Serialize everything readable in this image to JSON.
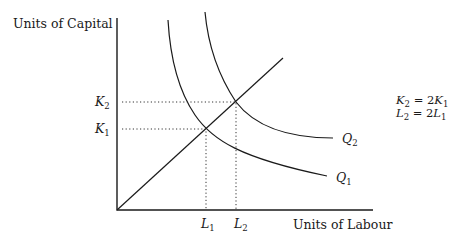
{
  "diagram": {
    "type": "isoquant returns-to-scale diagram",
    "y_axis_label": "Units of Capital",
    "x_axis_label": "Units of Labour",
    "capital_levels": [
      {
        "symbol": "K",
        "subscript": "1"
      },
      {
        "symbol": "K",
        "subscript": "2"
      }
    ],
    "labour_levels": [
      {
        "symbol": "L",
        "subscript": "1"
      },
      {
        "symbol": "L",
        "subscript": "2"
      }
    ],
    "isoquants": [
      {
        "symbol": "Q",
        "subscript": "1"
      },
      {
        "symbol": "Q",
        "subscript": "2"
      }
    ],
    "equations": [
      {
        "lhs_symbol": "K",
        "lhs_sub": "2",
        "op": " = 2",
        "rhs_symbol": "K",
        "rhs_sub": "1"
      },
      {
        "lhs_symbol": "L",
        "lhs_sub": "2",
        "op": " = 2",
        "rhs_symbol": "L",
        "rhs_sub": "1"
      }
    ],
    "colors": {
      "ink": "#1a1a1a",
      "background": "#ffffff"
    }
  }
}
